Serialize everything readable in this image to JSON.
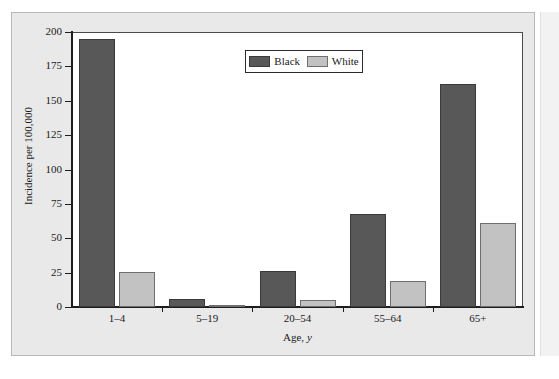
{
  "chart_data": {
    "type": "bar",
    "title": "",
    "subtitle": "",
    "xlabel": "Age, y",
    "xlabel_parts": {
      "text": "Age,",
      "italic": "y"
    },
    "ylabel": "Incidence per 100,000",
    "categories": [
      "1–4",
      "5–19",
      "20–54",
      "55–64",
      "65+"
    ],
    "series": [
      {
        "name": "Black",
        "color": "#585858",
        "values": [
          195,
          5.5,
          26,
          68,
          162
        ]
      },
      {
        "name": "White",
        "color": "#c2c2c2",
        "values": [
          25.5,
          1,
          5,
          19,
          61
        ]
      }
    ],
    "ylim": [
      0,
      200
    ],
    "yticks": [
      0,
      25,
      50,
      75,
      100,
      125,
      150,
      175,
      200
    ],
    "ytick_labels": [
      "0",
      "25",
      "50",
      "75",
      "100",
      "125",
      "150",
      "175",
      "200"
    ],
    "grid": false,
    "legend_position": "upper center",
    "legend_entries": [
      "Black",
      "White"
    ]
  },
  "colors": {
    "panel_background": "#e9e9e9",
    "plot_background": "#ffffff",
    "axis": "#1d1d1d",
    "black_series": "#585858",
    "white_series": "#c2c2c2",
    "page_background": "#ffffff"
  }
}
